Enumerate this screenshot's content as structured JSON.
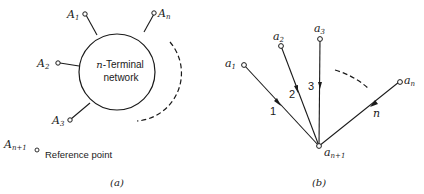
{
  "panel_a": {
    "caption": "(a)",
    "network_label_line1_var": "n",
    "network_label_line1_text": "-Terminal",
    "network_label_line2": "network",
    "terminals": [
      {
        "base": "A",
        "sub": "1"
      },
      {
        "base": "A",
        "sub": "2"
      },
      {
        "base": "A",
        "sub": "3"
      },
      {
        "base": "A",
        "sub": "n"
      }
    ],
    "reference": {
      "base": "A",
      "sub": "n+1",
      "label": "Reference point"
    }
  },
  "panel_b": {
    "caption": "(b)",
    "nodes": [
      {
        "base": "a",
        "sub": "1"
      },
      {
        "base": "a",
        "sub": "2"
      },
      {
        "base": "a",
        "sub": "3"
      },
      {
        "base": "a",
        "sub": "n"
      },
      {
        "base": "a",
        "sub": "n+1"
      }
    ],
    "edge_labels": [
      "1",
      "2",
      "3",
      "n"
    ]
  },
  "colors": {
    "ink": "#1a1a1a",
    "background": "#ffffff"
  }
}
